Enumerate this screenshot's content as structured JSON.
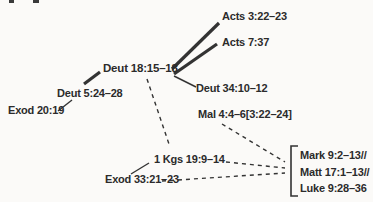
{
  "diagram": {
    "type": "node-link-diagram",
    "colors": {
      "ink": "#2b2b2b",
      "background": "#fbfaf8"
    },
    "nodes": [
      {
        "id": "acts-3",
        "label": "Acts 3:22–23"
      },
      {
        "id": "acts-7",
        "label": "Acts 7:37"
      },
      {
        "id": "deut-18",
        "label": "Deut 18:15–18",
        "emphasis": "bold"
      },
      {
        "id": "deut-34",
        "label": "Deut 34:10–12"
      },
      {
        "id": "deut-5",
        "label": "Deut 5:24–28"
      },
      {
        "id": "exod-20",
        "label": "Exod 20:19"
      },
      {
        "id": "mal",
        "label": "Mal 4:4–6[3:22–24]"
      },
      {
        "id": "kgs",
        "label": "1 Kgs 19:9–14"
      },
      {
        "id": "exod-33",
        "label": "Exod 33:21–23"
      },
      {
        "id": "mark",
        "label": "Mark 9:2–13//"
      },
      {
        "id": "matt",
        "label": "Matt 17:1–13//"
      },
      {
        "id": "luke",
        "label": "Luke 9:28–36"
      }
    ],
    "bracket_group": [
      "Mark 9:2–13//",
      "Matt 17:1–13//",
      "Luke 9:28–36"
    ],
    "edges": [
      {
        "from": "deut-18",
        "to": "acts-3",
        "style": "solid-thick"
      },
      {
        "from": "deut-18",
        "to": "acts-7",
        "style": "solid-thick"
      },
      {
        "from": "deut-5",
        "to": "deut-18",
        "style": "solid-thick"
      },
      {
        "from": "exod-20",
        "to": "deut-5",
        "style": "solid-thin"
      },
      {
        "from": "deut-18",
        "to": "deut-34",
        "style": "solid-thin"
      },
      {
        "from": "exod-33",
        "to": "kgs",
        "style": "solid-thin"
      },
      {
        "from": "deut-18",
        "to": "kgs",
        "style": "dashed"
      },
      {
        "from": "mal",
        "to": "synoptics-bracket",
        "style": "dashed"
      },
      {
        "from": "kgs",
        "to": "synoptics-bracket",
        "style": "dashed"
      },
      {
        "from": "exod-33",
        "to": "synoptics-bracket",
        "style": "dashed"
      }
    ]
  }
}
